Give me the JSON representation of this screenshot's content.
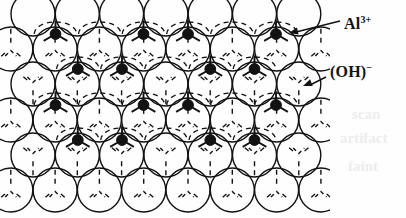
{
  "figure": {
    "name": "gibbsite-octahedral-sheet",
    "background_color": "#fefefe",
    "ink_color": "#121212"
  },
  "labels": {
    "aluminum": {
      "text": "Al",
      "charge": "3+",
      "full": "Al3+"
    },
    "hydroxyl": {
      "text": "(OH)",
      "charge": "−",
      "full": "(OH)-"
    }
  },
  "legend_items": [
    {
      "id": "al-ion",
      "label": "Al3+",
      "marker": "filled-black-dot",
      "color": "#121212"
    },
    {
      "id": "oh-ion",
      "label": "(OH)-",
      "marker": "open-circle",
      "color": "#121212"
    }
  ],
  "geometry": {
    "circle_radius": 22,
    "x_spacing": 44.3,
    "y_spacing": 35.5,
    "stroke_width": 1.4,
    "dot_radius": 5.4,
    "dash_pattern": "5,4",
    "circle_rows": [
      {
        "row": 0,
        "cy": 14,
        "x_start": 33.0,
        "count": 7
      },
      {
        "row": 1,
        "cy": 49,
        "x_start": 10.8,
        "count": 8
      },
      {
        "row": 2,
        "cy": 84,
        "x_start": 33.0,
        "count": 7
      },
      {
        "row": 3,
        "cy": 120,
        "x_start": 10.8,
        "count": 8
      },
      {
        "row": 4,
        "cy": 155,
        "x_start": 33.0,
        "count": 7
      },
      {
        "row": 5,
        "cy": 190,
        "x_start": 10.8,
        "count": 8
      }
    ],
    "dot_rows": [
      {
        "row": 0,
        "cy": 34,
        "xs": [
          55.5,
          143.5,
          188.0,
          276.0
        ],
        "vacancies": [
          99.8,
          232.0
        ]
      },
      {
        "row": 1,
        "cy": 69,
        "xs": [
          77.8,
          122.0,
          210.3,
          254.5
        ],
        "vacancies": [
          166.0
        ]
      },
      {
        "row": 2,
        "cy": 105,
        "xs": [
          55.5,
          143.5,
          188.0,
          276.0
        ],
        "vacancies": [
          99.8,
          232.0
        ]
      },
      {
        "row": 3,
        "cy": 140,
        "xs": [
          77.8,
          122.0,
          210.3,
          254.5
        ],
        "vacancies": [
          166.0
        ]
      }
    ]
  },
  "annotations": [
    {
      "id": "al-leader",
      "label": "Al3+",
      "arrow_from": [
        340,
        21
      ],
      "arrow_to": [
        289,
        33
      ]
    },
    {
      "id": "oh-leader",
      "label": "(OH)-",
      "arrow_from": [
        326,
        77
      ],
      "arrow_to": [
        303,
        86
      ]
    }
  ],
  "bleed_through": [
    {
      "text": "scan",
      "x": 352,
      "y": 106,
      "size": 15
    },
    {
      "text": "artifact",
      "x": 340,
      "y": 130,
      "size": 15
    },
    {
      "text": "faint",
      "x": 348,
      "y": 158,
      "size": 15
    }
  ]
}
